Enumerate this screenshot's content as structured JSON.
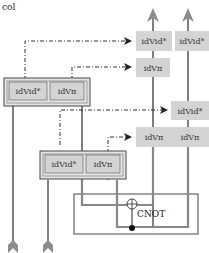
{
  "caption": "col",
  "colors": {
    "box_fill": "#d4d4d4",
    "wire": "#555555",
    "wire_light": "#9a9a9a",
    "arrow_head": "#8c8c8c",
    "dash_line": "#333333",
    "frame": "#444444"
  },
  "left_group": {
    "boxes": [
      {
        "label": "idVid*"
      },
      {
        "label": "idVπ"
      }
    ]
  },
  "middle_group": {
    "boxes": [
      {
        "label": "idVid*"
      },
      {
        "label": "idVπ"
      }
    ]
  },
  "right_column": {
    "boxes": [
      {
        "label": "idVid*"
      },
      {
        "label": "idVid*"
      },
      {
        "label": "idVπ"
      },
      {
        "label": "idVid*"
      },
      {
        "label": "idVπ"
      },
      {
        "label": "idVπ"
      }
    ]
  },
  "gate": {
    "label": "CNOT"
  }
}
